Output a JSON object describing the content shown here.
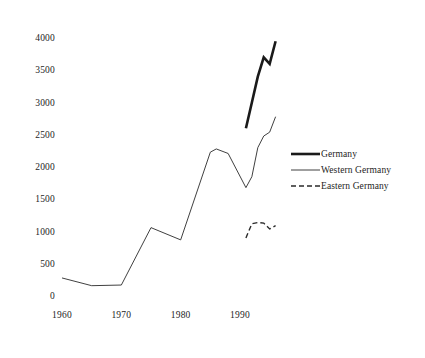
{
  "chart_data": {
    "type": "line",
    "title": "",
    "subtitle": "",
    "xlabel": "",
    "ylabel": "",
    "xlim": [
      1958,
      1998
    ],
    "ylim": [
      0,
      4100
    ],
    "grid": false,
    "legend_position": "right",
    "x_ticks": [
      "1960",
      "1970",
      "1980",
      "1990"
    ],
    "x_tick_values": [
      1960,
      1970,
      1980,
      1990
    ],
    "y_ticks": [
      "0",
      "500",
      "1000",
      "1500",
      "2000",
      "2500",
      "3000",
      "3500",
      "4000"
    ],
    "y_tick_values": [
      0,
      500,
      1000,
      1500,
      2000,
      2500,
      3000,
      3500,
      4000
    ],
    "series": [
      {
        "name": "Germany",
        "style": "thick-solid",
        "color": "#1a1a1a",
        "width": 2.6,
        "x": [
          1991,
          1992,
          1993,
          1994,
          1995,
          1996
        ],
        "values": [
          2600,
          3000,
          3400,
          3700,
          3600,
          3950
        ]
      },
      {
        "name": "Western Germany",
        "style": "thin-solid",
        "color": "#2a2a2a",
        "width": 0.9,
        "x": [
          1960,
          1965,
          1970,
          1975,
          1980,
          1985,
          1986,
          1988,
          1991,
          1992,
          1993,
          1994,
          1995,
          1996
        ],
        "values": [
          280,
          160,
          170,
          1060,
          870,
          2230,
          2280,
          2210,
          1680,
          1850,
          2300,
          2480,
          2540,
          2780
        ]
      },
      {
        "name": "Eastern Germany",
        "style": "dashed",
        "color": "#2a2a2a",
        "width": 1.4,
        "x": [
          1991,
          1992,
          1993,
          1994,
          1995,
          1996
        ],
        "values": [
          900,
          1120,
          1140,
          1130,
          1040,
          1090
        ]
      }
    ]
  },
  "legend": {
    "items": [
      {
        "label": "Germany",
        "style": "thick-solid"
      },
      {
        "label": "Western Germany",
        "style": "thin-solid"
      },
      {
        "label": "Eastern Germany",
        "style": "dashed"
      }
    ]
  },
  "colors": {
    "background": "#ffffff",
    "ink": "#1a1a1a",
    "tick_text": "#242424"
  }
}
